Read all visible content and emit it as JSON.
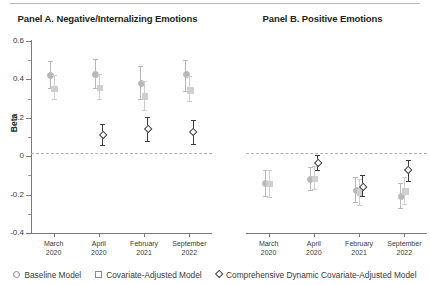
{
  "figure": {
    "top_rule": true,
    "panels": [
      {
        "id": "A",
        "title": "Panel A. Negative/Internalizing Emotions"
      },
      {
        "id": "B",
        "title": "Panel B. Positive Emotions"
      }
    ]
  },
  "legend": {
    "items": [
      {
        "marker": "circle-open-icon",
        "label": "Baseline Model",
        "color": "#b8b8b8"
      },
      {
        "marker": "square-open-icon",
        "label": "Covariate-Adjusted Model",
        "color": "#9e9e9e"
      },
      {
        "marker": "diamond-open-icon",
        "label": "Comprehensive Dynamic Covariate-Adjusted Model",
        "color": "#3a3a3a"
      }
    ]
  },
  "chart_data": [
    {
      "type": "scatter",
      "panel": "A",
      "title": "Panel A. Negative/Internalizing Emotions",
      "xlabel": "",
      "ylabel": "Beta",
      "ylim": [
        -0.4,
        0.6
      ],
      "yticks": [
        -0.4,
        -0.2,
        0,
        0.2,
        0.4,
        0.6
      ],
      "ytick_labels": [
        "-0.4",
        "-0.2",
        "0",
        "0.2",
        "0.4",
        "0.6"
      ],
      "grid": false,
      "zero_reference_line": 0,
      "categories": [
        "March 2020",
        "April 2020",
        "February 2021",
        "September 2022"
      ],
      "category_lines": [
        [
          "March",
          "2020"
        ],
        [
          "April",
          "2020"
        ],
        [
          "February",
          "2021"
        ],
        [
          "September",
          "2022"
        ]
      ],
      "series": [
        {
          "name": "Baseline Model",
          "marker": "circle",
          "color": "#b8b8b8",
          "values": [
            0.425,
            0.43,
            0.385,
            0.43
          ],
          "ci_low": [
            0.355,
            0.355,
            0.3,
            0.34
          ],
          "ci_high": [
            0.497,
            0.505,
            0.468,
            0.5
          ]
        },
        {
          "name": "Covariate-Adjusted Model",
          "marker": "square",
          "color": "#cfcfcf",
          "values": [
            0.356,
            0.36,
            0.315,
            0.348
          ],
          "ci_low": [
            0.3,
            0.298,
            0.24,
            0.29
          ],
          "ci_high": [
            0.425,
            0.43,
            0.39,
            0.42
          ]
        },
        {
          "name": "Comprehensive Dynamic Covariate-Adjusted Model",
          "marker": "diamond",
          "color": "#3a3a3a",
          "values": [
            null,
            0.113,
            0.145,
            0.13
          ],
          "ci_low": [
            null,
            0.06,
            0.078,
            0.062
          ],
          "ci_high": [
            null,
            0.168,
            0.205,
            0.19
          ]
        }
      ]
    },
    {
      "type": "scatter",
      "panel": "B",
      "title": "Panel B. Positive Emotions",
      "xlabel": "",
      "ylabel": "",
      "ylim": [
        -0.4,
        0.6
      ],
      "yticks": [
        -0.4,
        -0.2,
        0,
        0.2,
        0.4,
        0.6
      ],
      "ytick_labels": [],
      "grid": false,
      "zero_reference_line": 0,
      "categories": [
        "March 2020",
        "April 2020",
        "February 2021",
        "September 2022"
      ],
      "category_lines": [
        [
          "March",
          "2020"
        ],
        [
          "April",
          "2020"
        ],
        [
          "February",
          "2021"
        ],
        [
          "September",
          "2022"
        ]
      ],
      "series": [
        {
          "name": "Baseline Model",
          "marker": "circle",
          "color": "#b8b8b8",
          "values": [
            -0.135,
            -0.115,
            -0.175,
            -0.205
          ],
          "ci_low": [
            -0.205,
            -0.175,
            -0.24,
            -0.27
          ],
          "ci_high": [
            -0.07,
            -0.055,
            -0.11,
            -0.14
          ]
        },
        {
          "name": "Covariate-Adjusted Model",
          "marker": "square",
          "color": "#cfcfcf",
          "values": [
            -0.14,
            -0.113,
            -0.185,
            -0.178
          ],
          "ci_low": [
            -0.21,
            -0.17,
            -0.255,
            -0.248
          ],
          "ci_high": [
            -0.072,
            -0.052,
            -0.118,
            -0.11
          ]
        },
        {
          "name": "Comprehensive Dynamic Covariate-Adjusted Model",
          "marker": "diamond",
          "color": "#3a3a3a",
          "values": [
            null,
            -0.03,
            -0.155,
            -0.07
          ],
          "ci_low": [
            null,
            -0.072,
            -0.208,
            -0.13
          ],
          "ci_high": [
            null,
            0.005,
            -0.098,
            -0.018
          ]
        }
      ]
    }
  ]
}
